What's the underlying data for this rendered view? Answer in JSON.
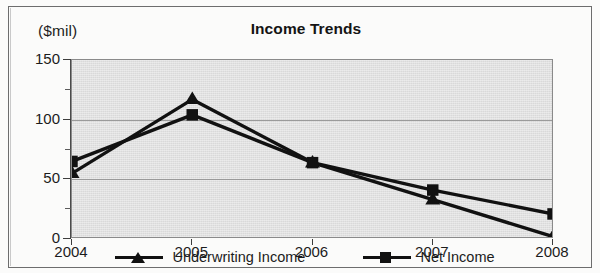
{
  "chart_data": {
    "type": "line",
    "title": "Income Trends",
    "xlabel": "",
    "ylabel": "($mil)",
    "unit_caption": "($mil)",
    "categories": [
      "2004",
      "2005",
      "2006",
      "2007",
      "2008"
    ],
    "series": [
      {
        "name": "Underwriting Income",
        "marker": "triangle",
        "color": "#111111",
        "values": [
          55,
          117,
          64,
          33,
          2
        ]
      },
      {
        "name": "Net Income",
        "marker": "square",
        "color": "#111111",
        "values": [
          65,
          104,
          64,
          41,
          21
        ]
      }
    ],
    "ylim": [
      0,
      150
    ],
    "yticks": [
      0,
      50,
      100,
      150
    ],
    "yticklabels": [
      "0",
      "50",
      "100",
      "150"
    ],
    "yminorticks": [
      25,
      75,
      125
    ],
    "grid": true,
    "grid_axis": "y",
    "legend_position": "bottom",
    "plot_background": "#d9d9d9"
  },
  "legend": {
    "entries": [
      {
        "label": "Underwriting Income",
        "marker": "triangle-marker-icon"
      },
      {
        "label": "Net Income",
        "marker": "square-marker-icon"
      }
    ]
  }
}
